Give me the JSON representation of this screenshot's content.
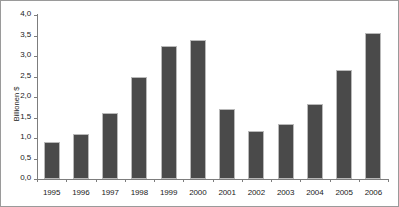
{
  "chart_data": {
    "type": "bar",
    "title": "",
    "subtitle": "",
    "xlabel": "",
    "ylabel": "Billionen $",
    "categories": [
      "1995",
      "1996",
      "1997",
      "1998",
      "1999",
      "2000",
      "2001",
      "2002",
      "2003",
      "2004",
      "2005",
      "2006"
    ],
    "values": [
      0.9,
      1.1,
      1.6,
      2.5,
      3.25,
      3.4,
      1.7,
      1.17,
      1.33,
      1.83,
      2.65,
      3.55
    ],
    "ylim": [
      0,
      4.0
    ],
    "ytick_step": 0.5,
    "ytick_labels": [
      "0,0",
      "0,5",
      "1,0",
      "1,5",
      "2,0",
      "2,5",
      "3,0",
      "3,5",
      "4,0"
    ],
    "ytick_values": [
      0,
      0.5,
      1.0,
      1.5,
      2.0,
      2.5,
      3.0,
      3.5,
      4.0
    ],
    "decimal_separator": ",",
    "grid": false,
    "legend": false,
    "legend_position": "none",
    "series": [
      {
        "name": "Billionen $",
        "values": [
          0.9,
          1.1,
          1.6,
          2.5,
          3.25,
          3.4,
          1.7,
          1.17,
          1.33,
          1.83,
          2.65,
          3.55
        ]
      }
    ]
  },
  "style": {
    "bar_fill": "#4a4a4a",
    "bar_border": "#b9b9b9",
    "axis_color": "#7d7d7d",
    "text_color": "#1a1a1a",
    "background": "#ffffff",
    "frame_border": "#9a9a9a"
  }
}
